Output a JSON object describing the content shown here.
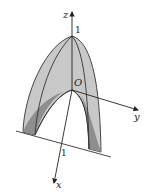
{
  "diagram": {
    "type": "3d-surface-sketch",
    "axes": {
      "x_label": "x",
      "y_label": "y",
      "z_label": "z",
      "origin_label": "O",
      "z_tick_label": "1",
      "x_tick_label": "1"
    },
    "colors": {
      "surface_light": "#c8c8c8",
      "surface_dark": "#8e8e8e",
      "outline": "#333333",
      "axis": "#222222"
    }
  }
}
